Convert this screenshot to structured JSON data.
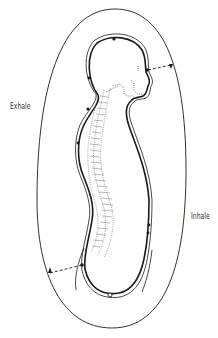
{
  "diagram": {
    "type": "breath-circulation-figure",
    "labels": {
      "exhale": "Exhale",
      "inhale": "Inhale"
    },
    "colors": {
      "background": "#ffffff",
      "line": "#1a1a1a",
      "dotted": "#555555",
      "label": "#333333"
    },
    "markers": [
      {
        "name": "crown-point",
        "x": 114,
        "y": 39
      },
      {
        "name": "brow-point",
        "x": 147,
        "y": 70
      },
      {
        "name": "back-of-head-point",
        "x": 89,
        "y": 78
      },
      {
        "name": "neck-back-point",
        "x": 88,
        "y": 109
      },
      {
        "name": "mid-back-point",
        "x": 78,
        "y": 143
      },
      {
        "name": "lower-back-point",
        "x": 82,
        "y": 265
      },
      {
        "name": "front-abdomen-point-1",
        "x": 149,
        "y": 225
      },
      {
        "name": "front-abdomen-point-2",
        "x": 148,
        "y": 233
      },
      {
        "name": "perineum-point",
        "x": 110,
        "y": 295
      }
    ]
  }
}
